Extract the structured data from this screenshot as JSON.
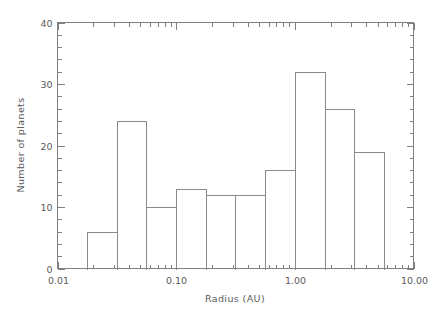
{
  "chart_data": {
    "type": "bar",
    "title": "",
    "subtitle": "",
    "xlabel": "Radius (AU)",
    "ylabel": "Number of planets",
    "xscale": "log",
    "yscale": "linear",
    "xlim": [
      0.01,
      10.0
    ],
    "ylim": [
      0,
      40
    ],
    "grid": false,
    "legend": null,
    "x_tick_labels": [
      "0.01",
      "0.10",
      "1.00",
      "10.00"
    ],
    "x_tick_values": [
      0.01,
      0.1,
      1.0,
      10.0
    ],
    "y_tick_labels": [
      "0",
      "10",
      "20",
      "30",
      "40"
    ],
    "y_tick_values": [
      0,
      10,
      20,
      30,
      40
    ],
    "y_minor_tick_interval": 2,
    "bin_edges_au": [
      0.0178,
      0.0316,
      0.0562,
      0.1,
      0.1778,
      0.3162,
      0.5623,
      1.0,
      1.7783,
      3.1623,
      5.6234
    ],
    "categories": [
      "0.018-0.032",
      "0.032-0.056",
      "0.056-0.100",
      "0.100-0.178",
      "0.178-0.316",
      "0.316-0.562",
      "0.562-1.00",
      "1.00-1.78",
      "1.78-3.16",
      "3.16-5.62"
    ],
    "values": [
      6,
      24,
      10,
      13,
      12,
      12,
      16,
      32,
      26,
      19
    ],
    "annotations": []
  },
  "style": {
    "axis_color": "#808080",
    "bar_stroke": "#8a8a8a",
    "text_color": "#5a5a5a",
    "background": "#ffffff"
  }
}
